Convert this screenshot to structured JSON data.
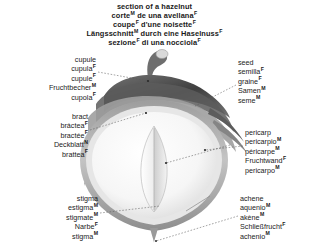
{
  "title": {
    "lines": [
      {
        "text": "section of a hazelnut",
        "gender": ""
      },
      {
        "text": "corte",
        "gender": "M",
        "rest": " de una avellana",
        "rest_gender": "F"
      },
      {
        "text": "coupe",
        "gender": "F",
        "rest": " d'une noisette",
        "rest_gender": "F"
      },
      {
        "text": "Längsschnitt",
        "gender": "M",
        "rest": " durch eine Haselnuss",
        "rest_gender": "F"
      },
      {
        "text": "sezione",
        "gender": "F",
        "rest": " di una nocciola",
        "rest_gender": "F"
      }
    ]
  },
  "labels": {
    "cupule": {
      "name": "cupule",
      "lines": [
        {
          "term": "cupule",
          "gender": ""
        },
        {
          "term": "cupula",
          "gender": "F"
        },
        {
          "term": "cupule",
          "gender": "F"
        },
        {
          "term": "Fruchtbecher",
          "gender": "M"
        },
        {
          "term": "cupola",
          "gender": "F"
        }
      ]
    },
    "bract": {
      "name": "bract",
      "lines": [
        {
          "term": "bract",
          "gender": ""
        },
        {
          "term": "bráctea",
          "gender": "F"
        },
        {
          "term": "bractée",
          "gender": "F"
        },
        {
          "term": "Deckblatt",
          "gender": "N"
        },
        {
          "term": "brattea",
          "gender": "F"
        }
      ]
    },
    "stigma": {
      "name": "stigma",
      "lines": [
        {
          "term": "stigma",
          "gender": ""
        },
        {
          "term": "estigma",
          "gender": "M"
        },
        {
          "term": "stigmate",
          "gender": "M"
        },
        {
          "term": "Narbe",
          "gender": "F"
        },
        {
          "term": "stigma",
          "gender": "M"
        }
      ]
    },
    "seed": {
      "name": "seed",
      "lines": [
        {
          "term": "seed",
          "gender": ""
        },
        {
          "term": "semilla",
          "gender": "F"
        },
        {
          "term": "graine",
          "gender": "F"
        },
        {
          "term": "Samen",
          "gender": "M"
        },
        {
          "term": "seme",
          "gender": "M"
        }
      ]
    },
    "pericarp": {
      "name": "pericarp",
      "lines": [
        {
          "term": "pericarp",
          "gender": ""
        },
        {
          "term": "pericarpio",
          "gender": "M"
        },
        {
          "term": "péricarpe",
          "gender": "M"
        },
        {
          "term": "Fruchtwand",
          "gender": "F"
        },
        {
          "term": "pericarpo",
          "gender": "M"
        }
      ]
    },
    "achene": {
      "name": "achene",
      "lines": [
        {
          "term": "achene",
          "gender": ""
        },
        {
          "term": "aquenio",
          "gender": "M"
        },
        {
          "term": "akène",
          "gender": "M"
        },
        {
          "term": "Schließfrucht",
          "gender": "F"
        },
        {
          "term": "achenio",
          "gender": "M"
        }
      ]
    }
  },
  "colors": {
    "text": "#1a1a1a",
    "leader": "#555555",
    "husk_dark": "#4a4a4a",
    "husk_mid": "#8a8a8a",
    "husk_light": "#c9c9c9",
    "shell": "#b5b5b5",
    "kernel": "#f2f2f2",
    "kernel_shadow": "#dedede",
    "background": "#ffffff"
  },
  "illustration": {
    "name": "hazelnut-longitudinal-section",
    "parts": [
      "cupule-husk",
      "bract-leaves",
      "pericarp-shell",
      "seed-kernel",
      "stigma-stalk",
      "achene-body"
    ]
  }
}
